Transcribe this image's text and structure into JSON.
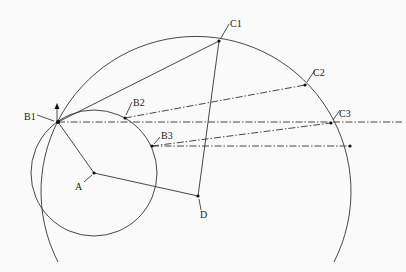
{
  "diagram": {
    "title": "",
    "colors": {
      "line": "#333333",
      "background": "#fafafa"
    },
    "points": {
      "A": {
        "label": "A",
        "x": 94,
        "y": 173
      },
      "B1": {
        "label": "B1",
        "x": 58,
        "y": 122
      },
      "B2": {
        "label": "B2",
        "x": 125,
        "y": 118
      },
      "B3": {
        "label": "B3",
        "x": 152,
        "y": 146
      },
      "C1": {
        "label": "C1",
        "x": 219,
        "y": 41
      },
      "C2": {
        "label": "C2",
        "x": 305,
        "y": 85
      },
      "C3": {
        "label": "C3",
        "x": 331,
        "y": 123
      },
      "D": {
        "label": "D",
        "x": 198,
        "y": 196
      }
    },
    "circles": [
      {
        "name": "small-circle",
        "center": "A",
        "r": 63
      },
      {
        "name": "large-arc",
        "cx": 196,
        "cy": 196,
        "r": 155
      }
    ],
    "segments": [
      {
        "from": "A",
        "to": "B1",
        "style": "solid"
      },
      {
        "from": "B1",
        "to": "C1",
        "style": "solid"
      },
      {
        "from": "C1",
        "to": "D",
        "style": "solid"
      },
      {
        "from": "A",
        "to": "D",
        "style": "solid"
      },
      {
        "from": "B2",
        "to": "C2",
        "style": "dash-dot"
      },
      {
        "from": "B3",
        "to": "C3",
        "style": "dash-dot"
      },
      {
        "from": "B1",
        "to": "horizontal-end",
        "style": "dash-dot"
      },
      {
        "from": "B3",
        "to": "projection-point",
        "style": "dash-dot"
      }
    ]
  }
}
